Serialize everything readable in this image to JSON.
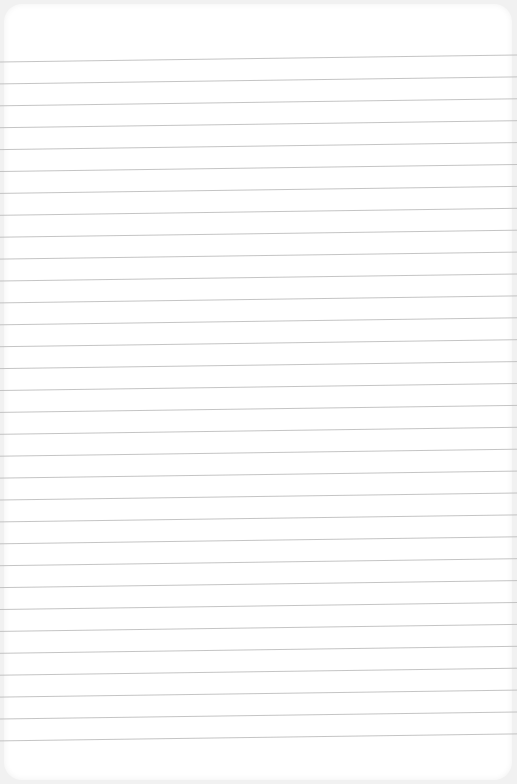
{
  "page": {
    "type": "lined-paper",
    "background_color": "#ffffff",
    "line_color": "#bdbdbd"
  },
  "lines": {
    "count": 32,
    "first_y_left": 62,
    "first_y_right": 55,
    "spacing": 21.9
  }
}
